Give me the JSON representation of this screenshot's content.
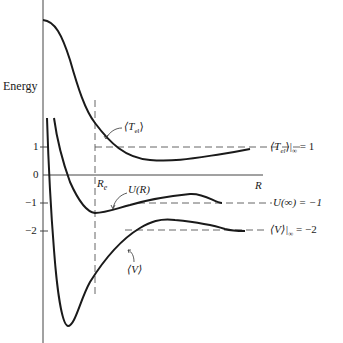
{
  "figure": {
    "ylabel": "Energy",
    "xlabel": "R",
    "equilibrium_label": "R",
    "equilibrium_sub": "e",
    "ticks": [
      {
        "value": 1,
        "label": "1"
      },
      {
        "value": 0,
        "label": "0"
      },
      {
        "value": -1,
        "label": "−1"
      },
      {
        "value": -2,
        "label": "−2"
      }
    ],
    "curves": [
      {
        "name": "T_el",
        "label": "⟨T",
        "label_sub": "el",
        "label_end": "⟩"
      },
      {
        "name": "U",
        "label": "U(R)"
      },
      {
        "name": "V",
        "label": "⟨V⟩"
      }
    ],
    "asymptotes": [
      {
        "curve": "T_el",
        "text": "⟨T",
        "sub": "el",
        "after": "⟩|",
        "sub2": "∞",
        "eq": " = 1",
        "value": 1
      },
      {
        "curve": "U",
        "text": "U(∞) = −1",
        "value": -1
      },
      {
        "curve": "V",
        "text": "⟨V⟩|",
        "sub2": "∞",
        "eq": " = −2",
        "value": -2
      }
    ],
    "colors": {
      "ink": "#1a1a1a",
      "dash": "#555555",
      "axis": "#444444"
    }
  }
}
